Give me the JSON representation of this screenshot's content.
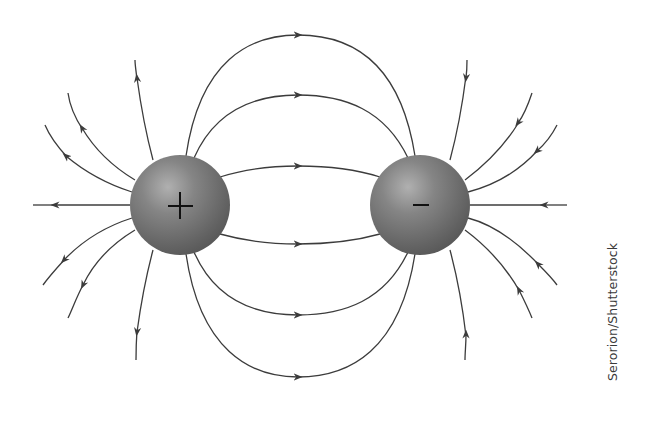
{
  "diagram": {
    "charges": [
      {
        "id": "positive",
        "sign": "+",
        "cx": 180,
        "cy": 205,
        "r": 50
      },
      {
        "id": "negative",
        "sign": "–",
        "cx": 420,
        "cy": 205,
        "r": 50
      }
    ],
    "colors": {
      "line": "#3c3c3c",
      "sphere_highlight": "#a9a9a9",
      "sphere_mid": "#7a7a7a",
      "sphere_shadow": "#555555",
      "sign": "#111111",
      "background": "#ffffff"
    },
    "field_line_count_between": 6,
    "field_line_count_outer_each": 7
  },
  "credit": {
    "text": "Serorion/Shutterstock"
  }
}
